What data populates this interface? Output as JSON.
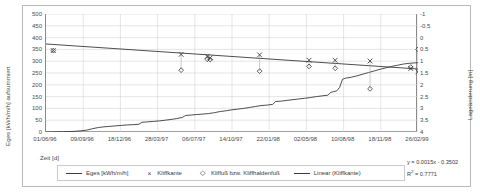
{
  "chart_data": {
    "type": "line",
    "title": "",
    "xlabel": "Zeit [d]",
    "ylabel": "Eges [kWh/m/h] aufsummiert",
    "y2label": "Lageänderung [m]",
    "grid": true,
    "legend_position": "bottom",
    "ylim": [
      0,
      500
    ],
    "yticks": [
      "0",
      "50",
      "100",
      "150",
      "200",
      "250",
      "300",
      "350",
      "400",
      "450",
      "500"
    ],
    "y2lim": [
      -1,
      4
    ],
    "y2_inverted": true,
    "y2ticks": [
      "-1",
      "-0.5",
      "0",
      "0.5",
      "1",
      "1.5",
      "2",
      "2.5",
      "3",
      "3.5",
      "4"
    ],
    "xticks": [
      "01/06/96",
      "09/09/96",
      "18/12/96",
      "28/03/97",
      "06/07/97",
      "14/10/97",
      "22/01/98",
      "02/05/98",
      "10/08/98",
      "18/11/98",
      "26/02/99"
    ],
    "series": [
      {
        "name": "Eges [kWh/m/h]",
        "type": "line",
        "axis": "left",
        "color": "#3a3a3a",
        "points": [
          [
            0,
            0
          ],
          [
            2,
            0
          ],
          [
            4,
            1
          ],
          [
            6,
            1
          ],
          [
            8,
            2
          ],
          [
            10,
            3
          ],
          [
            12,
            5
          ],
          [
            14,
            8
          ],
          [
            16,
            14
          ],
          [
            18,
            19
          ],
          [
            20,
            22
          ],
          [
            22,
            24
          ],
          [
            24,
            26
          ],
          [
            26,
            28
          ],
          [
            28,
            30
          ],
          [
            30,
            31
          ],
          [
            32,
            33
          ],
          [
            33,
            41
          ],
          [
            35,
            43
          ],
          [
            37,
            45
          ],
          [
            39,
            47
          ],
          [
            41,
            50
          ],
          [
            43,
            53
          ],
          [
            45,
            57
          ],
          [
            47,
            62
          ],
          [
            48,
            70
          ],
          [
            50,
            72
          ],
          [
            52,
            74
          ],
          [
            54,
            76
          ],
          [
            56,
            78
          ],
          [
            58,
            82
          ],
          [
            60,
            87
          ],
          [
            62,
            90
          ],
          [
            64,
            94
          ],
          [
            66,
            97
          ],
          [
            68,
            100
          ],
          [
            70,
            104
          ],
          [
            72,
            108
          ],
          [
            74,
            112
          ],
          [
            76,
            114
          ],
          [
            78,
            117
          ],
          [
            79,
            129
          ],
          [
            81,
            131
          ],
          [
            83,
            134
          ],
          [
            85,
            137
          ],
          [
            87,
            140
          ],
          [
            89,
            143
          ],
          [
            91,
            146
          ],
          [
            93,
            150
          ],
          [
            95,
            153
          ],
          [
            97,
            156
          ],
          [
            98,
            168
          ],
          [
            99,
            171
          ],
          [
            100,
            174
          ],
          [
            101,
            188
          ],
          [
            102,
            223
          ],
          [
            103,
            228
          ],
          [
            105,
            232
          ],
          [
            107,
            238
          ],
          [
            109,
            245
          ],
          [
            111,
            252
          ],
          [
            113,
            259
          ],
          [
            115,
            266
          ],
          [
            117,
            272
          ],
          [
            119,
            278
          ],
          [
            121,
            283
          ],
          [
            123,
            288
          ],
          [
            125,
            291
          ],
          [
            127,
            293
          ],
          [
            128,
            294
          ]
        ]
      },
      {
        "name": "Linear (Kliffkante)",
        "type": "trendline",
        "axis": "right",
        "color": "#3a3a3a",
        "equation": "y = 0.0015x - 0.3502",
        "r2": "R² = 0.7771",
        "endpoints": [
          [
            0,
            0.27
          ],
          [
            128,
            1.33
          ]
        ]
      },
      {
        "name": "Kliffkante",
        "type": "scatter",
        "marker": "x",
        "axis": "right",
        "color": "#3a3a3a",
        "points": [
          [
            2.5,
            0.55
          ],
          [
            46.5,
            0.71
          ],
          [
            55.5,
            0.79
          ],
          [
            56.5,
            0.86
          ],
          [
            73.5,
            0.73
          ],
          [
            90.5,
            0.96
          ],
          [
            99.5,
            0.96
          ],
          [
            111.5,
            0.99
          ],
          [
            125.5,
            1.31
          ],
          [
            128.0,
            1.45
          ]
        ]
      },
      {
        "name": "Kliffuß bzw. Kliffhaldenfuß",
        "type": "scatter",
        "marker": "diamond",
        "axis": "right",
        "color": "#3a3a3a",
        "points": [
          [
            2.5,
            0.55
          ],
          [
            46.5,
            1.38
          ],
          [
            55.5,
            0.92
          ],
          [
            56.5,
            0.93
          ],
          [
            73.5,
            1.42
          ],
          [
            90.5,
            1.22
          ],
          [
            99.5,
            1.3
          ],
          [
            111.5,
            2.17
          ],
          [
            125.5,
            1.25
          ],
          [
            128.0,
            0.5
          ]
        ]
      }
    ]
  },
  "axis": {
    "ytitle": "Eges [kWh/m/h] aufsummiert",
    "y2title": "Lageänderung [m]",
    "xtitle": "Zeit [d]"
  },
  "legend": {
    "items": [
      {
        "label": "Eges [kWh/m/h]",
        "marker": "line"
      },
      {
        "label": "Kliffkante",
        "marker": "×"
      },
      {
        "label": "Kliffuß bzw. Kliffhaldenfuß",
        "marker": "◇"
      },
      {
        "label": "Linear (Kliffkante)",
        "marker": "line"
      }
    ]
  },
  "equation": {
    "line": "y = 0.0015x - 0.3502",
    "r2_prefix": "R",
    "r2_sup": "2",
    "r2_value": " = 0.7771"
  },
  "colors": {
    "plot_line": "#3a3a3a",
    "grid": "#d4d4d4",
    "axis": "#8a8a8a",
    "frame": "#b8b8b8",
    "text": "#4a4a4a"
  }
}
